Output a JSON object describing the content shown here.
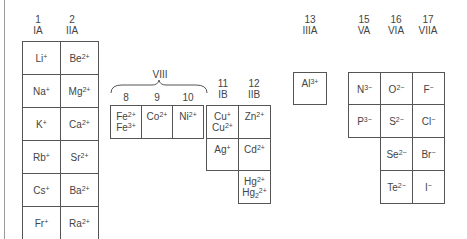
{
  "diagram": {
    "colors": {
      "line": "#555555",
      "text": "#444444",
      "frame": "#9a9a9a"
    },
    "group_headers": [
      {
        "id": "g1",
        "number": "1",
        "roman": "IA"
      },
      {
        "id": "g2",
        "number": "2",
        "roman": "IIA"
      },
      {
        "id": "g8",
        "number": "8",
        "roman": ""
      },
      {
        "id": "g9",
        "number": "9",
        "roman": ""
      },
      {
        "id": "g10",
        "number": "10",
        "roman": ""
      },
      {
        "id": "g11",
        "number": "11",
        "roman": "IB"
      },
      {
        "id": "g12",
        "number": "12",
        "roman": "IIB"
      },
      {
        "id": "g13",
        "number": "13",
        "roman": "IIIA"
      },
      {
        "id": "g15",
        "number": "15",
        "roman": "VA"
      },
      {
        "id": "g16",
        "number": "16",
        "roman": "VIA"
      },
      {
        "id": "g17",
        "number": "17",
        "roman": "VIIA"
      }
    ],
    "group_viii_label": "VIII",
    "ions": {
      "group1": [
        {
          "el": "Li",
          "ch": "+"
        },
        {
          "el": "Na",
          "ch": "+"
        },
        {
          "el": "K",
          "ch": "+"
        },
        {
          "el": "Rb",
          "ch": "+"
        },
        {
          "el": "Cs",
          "ch": "+"
        },
        {
          "el": "Fr",
          "ch": "+"
        }
      ],
      "group2": [
        {
          "el": "Be",
          "ch": "2+"
        },
        {
          "el": "Mg",
          "ch": "2+"
        },
        {
          "el": "Ca",
          "ch": "2+"
        },
        {
          "el": "Sr",
          "ch": "2+"
        },
        {
          "el": "Ba",
          "ch": "2+"
        },
        {
          "el": "Ra",
          "ch": "2+"
        }
      ],
      "group8": [
        [
          {
            "el": "Fe",
            "ch": "2+"
          },
          {
            "el": "Fe",
            "ch": "3+"
          }
        ]
      ],
      "group9": [
        {
          "el": "Co",
          "ch": "2+"
        }
      ],
      "group10": [
        {
          "el": "Ni",
          "ch": "2+"
        }
      ],
      "group11": [
        [
          {
            "el": "Cu",
            "ch": "+"
          },
          {
            "el": "Cu",
            "ch": "2+"
          }
        ],
        {
          "el": "Ag",
          "ch": "+"
        }
      ],
      "group12": [
        {
          "el": "Zn",
          "ch": "2+"
        },
        {
          "el": "Cd",
          "ch": "2+"
        },
        [
          {
            "el": "Hg",
            "ch": "2+"
          },
          {
            "el": "Hg",
            "sub": "2",
            "ch": "2+"
          }
        ]
      ],
      "group13": [
        {
          "el": "Al",
          "ch": "3+"
        }
      ],
      "group15": [
        {
          "el": "N",
          "ch": "3−"
        },
        {
          "el": "P",
          "ch": "3−"
        }
      ],
      "group16": [
        {
          "el": "O",
          "ch": "2−"
        },
        {
          "el": "S",
          "ch": "2−"
        },
        {
          "el": "Se",
          "ch": "2−"
        },
        {
          "el": "Te",
          "ch": "2−"
        }
      ],
      "group17": [
        {
          "el": "F",
          "ch": "−"
        },
        {
          "el": "Cl",
          "ch": "−"
        },
        {
          "el": "Br",
          "ch": "−"
        },
        {
          "el": "I",
          "ch": "−"
        }
      ]
    }
  }
}
